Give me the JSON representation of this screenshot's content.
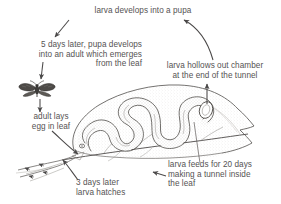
{
  "diagram": {
    "background_color": "#ffffff",
    "ink_color": "#555353",
    "captions": [
      {
        "id": "larva-develops-into-pupa",
        "text": "larva develops into a pupa"
      },
      {
        "id": "pupa-develops-into-adult",
        "text": "5 days later, pupa develops\ninto an adult which emerges\nfrom the leaf"
      },
      {
        "id": "larva-hollows-out-chamber",
        "text": "larva hollows out chamber\nat the end of the tunnel"
      },
      {
        "id": "adult-lays-egg",
        "text": "adult lays\negg in leaf"
      },
      {
        "id": "larva-hatches",
        "text": "3 days later\nlarva hatches"
      },
      {
        "id": "larva-feeds",
        "text": "larva feeds for 20 days\nmaking a tunnel inside\nthe leaf"
      }
    ],
    "illustrations": [
      {
        "id": "adult-moth",
        "label": "adult moth with spread wings"
      },
      {
        "id": "leaf",
        "label": "leaf with serpentine larval tunnel and chamber"
      },
      {
        "id": "leaf-stem",
        "label": "leaf stem and veins"
      }
    ],
    "arrows": [
      {
        "id": "arrow-to-adult-text",
        "label": "arrow from pupa caption down-left to adult caption"
      },
      {
        "id": "arrow-to-moth",
        "label": "arrow from adult caption down to moth"
      },
      {
        "id": "arrow-moth-to-leaf",
        "label": "arrow from moth down to egg site on leaf"
      },
      {
        "id": "arrow-egg-to-leaf",
        "label": "arrow from egg caption to leaf base"
      },
      {
        "id": "arrow-hatch",
        "label": "arrow from hatch caption to leaf base"
      },
      {
        "id": "arrow-feeds-to-tunnel",
        "label": "arrow from feeds caption to tunnel"
      },
      {
        "id": "arrow-chamber-up",
        "label": "vertical arrow from leaf chamber up to chamber caption"
      },
      {
        "id": "arrow-chamber-to-pupa",
        "label": "curved arrow from chamber caption up to pupa caption"
      }
    ]
  }
}
